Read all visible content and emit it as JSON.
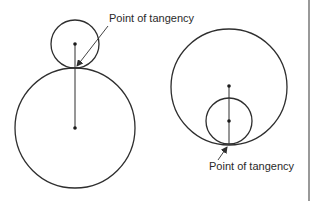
{
  "diagram": {
    "stroke_color": "#2e2e2e",
    "background": "#ffffff",
    "labels": {
      "external_tangency": "Point of tangency",
      "internal_tangency": "Point of tangency"
    },
    "figures": [
      {
        "name": "external-tangency",
        "small_circle": {
          "cx": 75,
          "cy": 44,
          "r": 24
        },
        "large_circle": {
          "cx": 75,
          "cy": 128,
          "r": 60
        },
        "tangent_point": {
          "x": 75,
          "y": 68
        },
        "center_line": {
          "x1": 75,
          "y1": 44,
          "x2": 75,
          "y2": 128
        }
      },
      {
        "name": "internal-tangency",
        "large_circle": {
          "cx": 229,
          "cy": 87,
          "r": 58
        },
        "small_circle": {
          "cx": 229,
          "cy": 121,
          "r": 23
        },
        "tangent_point": {
          "x": 229,
          "y": 144
        },
        "center_line": {
          "x1": 229,
          "y1": 86,
          "x2": 229,
          "y2": 144
        }
      }
    ]
  }
}
